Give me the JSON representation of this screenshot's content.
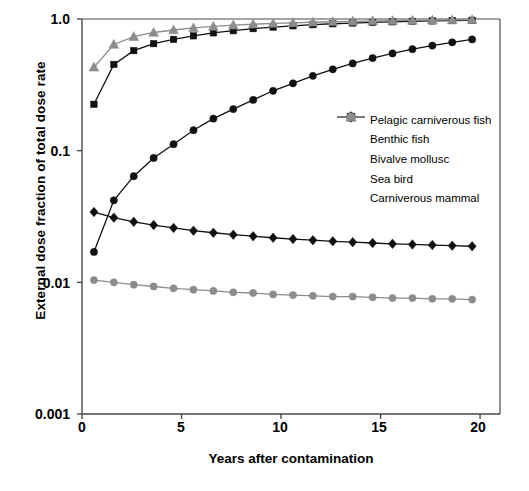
{
  "chart_data": {
    "type": "line",
    "title": "",
    "xlabel": "Years after contamination",
    "ylabel": "External dose fraction of total dose rate",
    "xlim": [
      0,
      21
    ],
    "ylim": [
      0.001,
      1.0
    ],
    "yscale": "log",
    "grid": false,
    "legend_position": "center-right",
    "xticks": [
      "0",
      "5",
      "10",
      "15",
      "20"
    ],
    "xtick_values": [
      0,
      5,
      10,
      15,
      20
    ],
    "yticks": [
      "1.0",
      "0.1",
      "0.01",
      "0.001"
    ],
    "ytick_values": [
      1.0,
      0.1,
      0.01,
      0.001
    ],
    "x": [
      0.6,
      1.6,
      2.6,
      3.6,
      4.6,
      5.6,
      6.6,
      7.6,
      8.6,
      9.6,
      10.6,
      11.6,
      12.6,
      13.6,
      14.6,
      15.6,
      16.6,
      17.6,
      18.6,
      19.6
    ],
    "series": [
      {
        "name": "Pelagic carniverous fish",
        "marker": "circle",
        "color": "#111111",
        "values": [
          0.017,
          0.042,
          0.064,
          0.088,
          0.112,
          0.143,
          0.175,
          0.207,
          0.243,
          0.285,
          0.325,
          0.37,
          0.415,
          0.46,
          0.505,
          0.548,
          0.59,
          0.628,
          0.665,
          0.7
        ]
      },
      {
        "name": "Benthic fish",
        "marker": "square",
        "color": "#111111",
        "values": [
          0.225,
          0.452,
          0.575,
          0.65,
          0.7,
          0.745,
          0.785,
          0.815,
          0.845,
          0.868,
          0.888,
          0.905,
          0.92,
          0.932,
          0.942,
          0.952,
          0.96,
          0.967,
          0.973,
          0.978
        ]
      },
      {
        "name": "Bivalve mollusc",
        "marker": "triangle",
        "color": "#8c8c8c",
        "values": [
          0.43,
          0.64,
          0.735,
          0.79,
          0.825,
          0.855,
          0.878,
          0.898,
          0.912,
          0.925,
          0.936,
          0.945,
          0.953,
          0.96,
          0.966,
          0.971,
          0.976,
          0.98,
          0.984,
          0.987
        ]
      },
      {
        "name": "Sea bird",
        "marker": "diamond",
        "color": "#111111",
        "values": [
          0.0342,
          0.031,
          0.0288,
          0.0272,
          0.0259,
          0.0247,
          0.0238,
          0.023,
          0.0224,
          0.0218,
          0.0213,
          0.0209,
          0.0205,
          0.0202,
          0.0199,
          0.0196,
          0.0194,
          0.0192,
          0.019,
          0.0188
        ]
      },
      {
        "name": "Carniverous mammal",
        "marker": "circle",
        "color": "#8c8c8c",
        "values": [
          0.0104,
          0.01,
          0.0096,
          0.0093,
          0.009,
          0.0088,
          0.0086,
          0.0084,
          0.0083,
          0.0081,
          0.008,
          0.0079,
          0.0078,
          0.0078,
          0.0077,
          0.0076,
          0.0076,
          0.0075,
          0.0075,
          0.0074
        ]
      }
    ]
  },
  "axes": {
    "plot_left": 82,
    "plot_right": 500,
    "plot_top": 19,
    "plot_bottom": 414
  }
}
